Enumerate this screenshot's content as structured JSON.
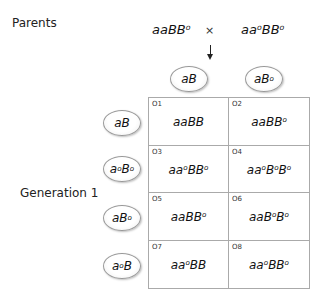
{
  "labels": {
    "parents": "Parents",
    "generation": "Generation 1"
  },
  "parents": {
    "left": "aaBB°",
    "cross_symbol": "×",
    "right": "aa°BB°"
  },
  "column_gametes": [
    "aB",
    "aB°"
  ],
  "row_gametes": [
    "aB",
    "a°B°",
    "aB°",
    "a°B"
  ],
  "cells": [
    {
      "id": "O1",
      "genotype": "aaBB"
    },
    {
      "id": "O2",
      "genotype": "aaBB°"
    },
    {
      "id": "O3",
      "genotype": "aa°BB°"
    },
    {
      "id": "O4",
      "genotype": "aa°B°B°"
    },
    {
      "id": "O5",
      "genotype": "aaBB°"
    },
    {
      "id": "O6",
      "genotype": "aaB°B°"
    },
    {
      "id": "O7",
      "genotype": "aa°BB"
    },
    {
      "id": "O8",
      "genotype": "aa°BB°"
    }
  ]
}
